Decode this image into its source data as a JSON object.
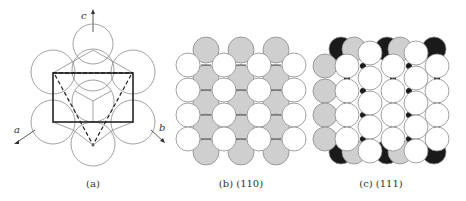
{
  "panels": [
    {
      "id": "a",
      "caption": "(a)",
      "axes": {
        "a": "a",
        "b": "b",
        "c": "c"
      }
    },
    {
      "id": "b",
      "caption": "(b) (110)"
    },
    {
      "id": "c",
      "caption": "(c) (111)"
    }
  ],
  "colors": {
    "line": "#777777",
    "bold": "#222222",
    "gray_fill": "#cfcfcf",
    "black_fill": "#1a1a1a",
    "white_fill": "#ffffff"
  }
}
